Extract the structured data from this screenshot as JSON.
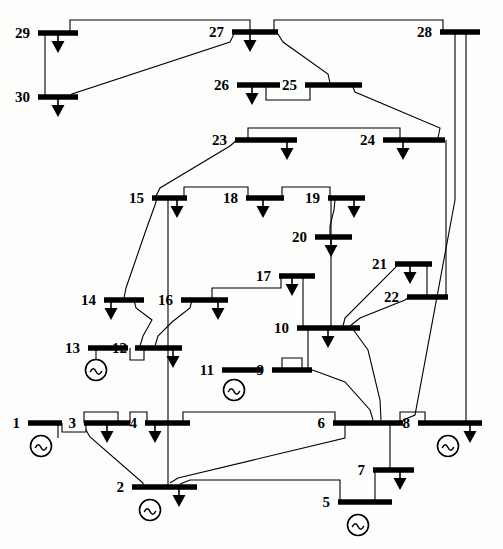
{
  "diagram": {
    "type": "single-line-diagram",
    "colors": {
      "line": "#000000",
      "background": "#fdfdfc",
      "label": "#000000"
    },
    "bus_count": 30,
    "buses": [
      {
        "id": "1",
        "label": "1",
        "x1": 28,
        "x2": 62,
        "y": 423,
        "label_x": 20,
        "label_y": 428,
        "label_anchor": "end"
      },
      {
        "id": "2",
        "label": "2",
        "x1": 132,
        "x2": 197,
        "y": 487,
        "label_x": 124,
        "label_y": 492,
        "label_anchor": "end"
      },
      {
        "id": "3",
        "label": "3",
        "x1": 84,
        "x2": 130,
        "y": 423,
        "label_x": 76,
        "label_y": 428,
        "label_anchor": "end"
      },
      {
        "id": "4",
        "label": "4",
        "x1": 145,
        "x2": 190,
        "y": 423,
        "label_x": 137,
        "label_y": 428,
        "label_anchor": "end"
      },
      {
        "id": "5",
        "label": "5",
        "x1": 338,
        "x2": 392,
        "y": 502,
        "label_x": 330,
        "label_y": 507,
        "label_anchor": "end"
      },
      {
        "id": "6",
        "label": "6",
        "x1": 333,
        "x2": 403,
        "y": 423,
        "label_x": 325,
        "label_y": 428,
        "label_anchor": "end"
      },
      {
        "id": "7",
        "label": "7",
        "x1": 373,
        "x2": 414,
        "y": 470,
        "label_x": 365,
        "label_y": 475,
        "label_anchor": "end"
      },
      {
        "id": "8",
        "label": "8",
        "x1": 418,
        "x2": 482,
        "y": 423,
        "label_x": 410,
        "label_y": 428,
        "label_anchor": "end"
      },
      {
        "id": "9",
        "label": "9",
        "x1": 272,
        "x2": 312,
        "y": 370,
        "label_x": 264,
        "label_y": 375,
        "label_anchor": "end"
      },
      {
        "id": "10",
        "label": "10",
        "x1": 297,
        "x2": 360,
        "y": 328,
        "label_x": 289,
        "label_y": 333,
        "label_anchor": "end"
      },
      {
        "id": "11",
        "label": "11",
        "x1": 222,
        "x2": 262,
        "y": 370,
        "label_x": 214,
        "label_y": 375,
        "label_anchor": "end"
      },
      {
        "id": "12",
        "label": "12",
        "x1": 135,
        "x2": 182,
        "y": 348,
        "label_x": 127,
        "label_y": 353,
        "label_anchor": "end"
      },
      {
        "id": "13",
        "label": "13",
        "x1": 88,
        "x2": 128,
        "y": 348,
        "label_x": 80,
        "label_y": 353,
        "label_anchor": "end"
      },
      {
        "id": "14",
        "label": "14",
        "x1": 104,
        "x2": 144,
        "y": 300,
        "label_x": 96,
        "label_y": 305,
        "label_anchor": "end"
      },
      {
        "id": "15",
        "label": "15",
        "x1": 152,
        "x2": 187,
        "y": 198,
        "label_x": 144,
        "label_y": 203,
        "label_anchor": "end"
      },
      {
        "id": "16",
        "label": "16",
        "x1": 181,
        "x2": 228,
        "y": 300,
        "label_x": 173,
        "label_y": 305,
        "label_anchor": "end"
      },
      {
        "id": "17",
        "label": "17",
        "x1": 279,
        "x2": 315,
        "y": 276,
        "label_x": 271,
        "label_y": 281,
        "label_anchor": "end"
      },
      {
        "id": "18",
        "label": "18",
        "x1": 246,
        "x2": 284,
        "y": 198,
        "label_x": 238,
        "label_y": 203,
        "label_anchor": "end"
      },
      {
        "id": "19",
        "label": "19",
        "x1": 328,
        "x2": 365,
        "y": 198,
        "label_x": 320,
        "label_y": 203,
        "label_anchor": "end"
      },
      {
        "id": "20",
        "label": "20",
        "x1": 315,
        "x2": 352,
        "y": 237,
        "label_x": 307,
        "label_y": 242,
        "label_anchor": "end"
      },
      {
        "id": "21",
        "label": "21",
        "x1": 395,
        "x2": 432,
        "y": 264,
        "label_x": 387,
        "label_y": 269,
        "label_anchor": "end"
      },
      {
        "id": "22",
        "label": "22",
        "x1": 407,
        "x2": 448,
        "y": 297,
        "label_x": 399,
        "label_y": 302,
        "label_anchor": "end"
      },
      {
        "id": "23",
        "label": "23",
        "x1": 235,
        "x2": 297,
        "y": 140,
        "label_x": 227,
        "label_y": 145,
        "label_anchor": "end"
      },
      {
        "id": "24",
        "label": "24",
        "x1": 383,
        "x2": 445,
        "y": 140,
        "label_x": 375,
        "label_y": 145,
        "label_anchor": "end"
      },
      {
        "id": "25",
        "label": "25",
        "x1": 305,
        "x2": 362,
        "y": 85,
        "label_x": 297,
        "label_y": 90,
        "label_anchor": "end"
      },
      {
        "id": "26",
        "label": "26",
        "x1": 237,
        "x2": 280,
        "y": 85,
        "label_x": 229,
        "label_y": 90,
        "label_anchor": "end"
      },
      {
        "id": "27",
        "label": "27",
        "x1": 232,
        "x2": 278,
        "y": 32,
        "label_x": 224,
        "label_y": 37,
        "label_anchor": "end"
      },
      {
        "id": "28",
        "label": "28",
        "x1": 440,
        "x2": 480,
        "y": 32,
        "label_x": 432,
        "label_y": 37,
        "label_anchor": "end"
      },
      {
        "id": "29",
        "label": "29",
        "x1": 38,
        "x2": 78,
        "y": 33,
        "label_x": 30,
        "label_y": 38,
        "label_anchor": "end"
      },
      {
        "id": "30",
        "label": "30",
        "x1": 38,
        "x2": 78,
        "y": 97,
        "label_x": 30,
        "label_y": 102,
        "label_anchor": "end"
      }
    ],
    "generators": [
      {
        "bus": "1",
        "x": 41,
        "y": 446
      },
      {
        "bus": "2",
        "x": 150,
        "y": 510
      },
      {
        "bus": "5",
        "x": 358,
        "y": 525
      },
      {
        "bus": "8",
        "x": 448,
        "y": 446
      },
      {
        "bus": "11",
        "x": 234,
        "y": 390
      },
      {
        "bus": "13",
        "x": 96,
        "y": 370
      }
    ],
    "loads": [
      {
        "bus": "2",
        "x": 179,
        "y": 487
      },
      {
        "bus": "3",
        "x": 107,
        "y": 423
      },
      {
        "bus": "4",
        "x": 155,
        "y": 423
      },
      {
        "bus": "7",
        "x": 400,
        "y": 470
      },
      {
        "bus": "8",
        "x": 470,
        "y": 423
      },
      {
        "bus": "10",
        "x": 328,
        "y": 328
      },
      {
        "bus": "12",
        "x": 173,
        "y": 348
      },
      {
        "bus": "14",
        "x": 111,
        "y": 300
      },
      {
        "bus": "15",
        "x": 177,
        "y": 198
      },
      {
        "bus": "16",
        "x": 218,
        "y": 300
      },
      {
        "bus": "17",
        "x": 292,
        "y": 276
      },
      {
        "bus": "18",
        "x": 263,
        "y": 198
      },
      {
        "bus": "19",
        "x": 354,
        "y": 198
      },
      {
        "bus": "20",
        "x": 331,
        "y": 237
      },
      {
        "bus": "21",
        "x": 410,
        "y": 264
      },
      {
        "bus": "23",
        "x": 287,
        "y": 140
      },
      {
        "bus": "24",
        "x": 403,
        "y": 140
      },
      {
        "bus": "26",
        "x": 252,
        "y": 85
      },
      {
        "bus": "27",
        "x": 250,
        "y": 32
      },
      {
        "bus": "29",
        "x": 58,
        "y": 33
      },
      {
        "bus": "30",
        "x": 58,
        "y": 97
      }
    ],
    "branches": [
      {
        "from": "1",
        "to": "2",
        "path": "M 58 423 L 58 438"
      },
      {
        "from": "1",
        "to": "3",
        "path": "M 62 423 L 62 432 L 86 432 L 86 423"
      },
      {
        "from": "3",
        "to": "4",
        "path": "M 118 423 L 118 412 L 84 412 L 84 423"
      },
      {
        "from": "3b",
        "to": "4b",
        "path": "M 130 423 L 130 412 L 147 412 L 147 423"
      },
      {
        "from": "4",
        "to": "6",
        "path": "M 183 423 L 183 412 L 335 412 L 335 423"
      },
      {
        "from": "2",
        "to": "4",
        "path": "M 86 430 L 90 437 L 143 483 L 143 487"
      },
      {
        "from": "2",
        "to": "6",
        "path": "M 170 483 L 178 478 L 345 438 L 345 423"
      },
      {
        "from": "2",
        "to": "5",
        "path": "M 180 484 L 190 480 L 340 480 L 340 502"
      },
      {
        "from": "6",
        "to": "7",
        "path": "M 390 423 L 390 470"
      },
      {
        "from": "5",
        "to": "7",
        "path": "M 375 502 L 375 470"
      },
      {
        "from": "6",
        "to": "8",
        "path": "M 400 423 L 400 412 L 425 412 L 425 423"
      },
      {
        "from": "8",
        "to": "28",
        "path": "M 466 423 L 466 32"
      },
      {
        "from": "6",
        "to": "28",
        "path": "M 403 420 L 415 415 L 455 200 L 455 32"
      },
      {
        "from": "6",
        "to": "9",
        "path": "M 373 420 L 370 410 L 345 382 L 318 372 L 312 370"
      },
      {
        "from": "6",
        "to": "10",
        "path": "M 381 420 L 380 400 L 368 350 L 355 332 L 352 328"
      },
      {
        "from": "9",
        "to": "11",
        "path": "M 282 370 L 282 358 L 302 358 L 302 370"
      },
      {
        "from": "9",
        "to": "10",
        "path": "M 308 370 L 308 328"
      },
      {
        "from": "10",
        "to": "17",
        "path": "M 303 328 L 303 276"
      },
      {
        "from": "10",
        "to": "20",
        "path": "M 331 328 L 331 198"
      },
      {
        "from": "10",
        "to": "21",
        "path": "M 343 326 L 345 318 L 395 268 L 398 264"
      },
      {
        "from": "10",
        "to": "22",
        "path": "M 350 326 L 360 318 L 405 300 L 409 297"
      },
      {
        "from": "21",
        "to": "22",
        "path": "M 427 264 L 427 297"
      },
      {
        "from": "22",
        "to": "24",
        "path": "M 446 297 L 446 140"
      },
      {
        "from": "12",
        "to": "15",
        "path": "M 168 348 L 168 198"
      },
      {
        "from": "12",
        "to": "4",
        "path": "M 168 348 L 168 423"
      },
      {
        "from": "4",
        "to": "2",
        "path": "M 168 423 L 168 487"
      },
      {
        "from": "12",
        "to": "13",
        "path": "M 144 348 L 144 360 L 130 360 L 130 348"
      },
      {
        "from": "13",
        "to": "gen",
        "path": "M 96 348 L 96 360"
      },
      {
        "from": "12",
        "to": "14",
        "path": "M 140 346 L 143 336 L 152 320 L 136 308 L 134 300"
      },
      {
        "from": "12",
        "to": "16",
        "path": "M 155 346 L 158 336 L 172 322 L 190 308 L 192 300"
      },
      {
        "from": "14",
        "to": "15",
        "path": "M 124 298 L 126 288 L 146 230 L 155 205 L 157 198"
      },
      {
        "from": "16",
        "to": "17",
        "path": "M 212 300 L 212 288 L 281 288 L 281 276"
      },
      {
        "from": "15",
        "to": "18",
        "path": "M 184 198 L 184 187 L 248 187 L 248 198"
      },
      {
        "from": "18",
        "to": "19",
        "path": "M 282 198 L 282 187 L 330 187 L 330 198"
      },
      {
        "from": "19",
        "to": "20",
        "path": "M 335 200 L 334 210 L 330 226 L 330 237"
      },
      {
        "from": "15",
        "to": "23",
        "path": "M 156 196 L 160 188 L 230 146 L 237 140"
      },
      {
        "from": "23",
        "to": "24",
        "path": "M 248 140 L 248 128 L 400 128 L 400 140"
      },
      {
        "from": "24",
        "to": "25",
        "path": "M 438 138 L 440 128 L 355 92 L 352 85"
      },
      {
        "from": "25",
        "to": "26",
        "path": "M 310 85 L 310 100 L 266 100 L 266 85"
      },
      {
        "from": "25",
        "to": "27",
        "path": "M 330 83 L 328 74 L 283 42 L 278 34"
      },
      {
        "from": "27",
        "to": "28",
        "path": "M 274 32 L 274 20 L 443 20 L 443 32"
      },
      {
        "from": "27",
        "to": "29",
        "path": "M 250 32 L 250 20 L 70 20 L 70 33"
      },
      {
        "from": "27",
        "to": "30",
        "path": "M 234 34 L 230 42 L 72 94 L 70 97"
      },
      {
        "from": "29",
        "to": "30",
        "path": "M 45 33 L 45 97"
      }
    ]
  }
}
